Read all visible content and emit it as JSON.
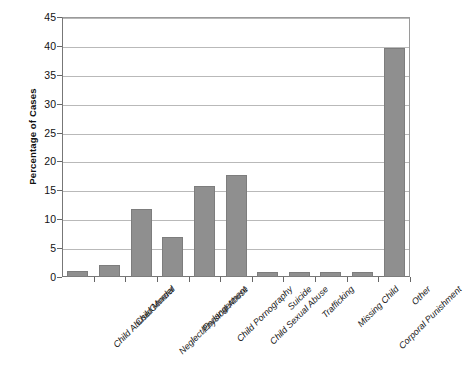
{
  "chart_data": {
    "type": "bar",
    "title": "",
    "subtitle": "",
    "xlabel": "",
    "ylabel": "Percentage of Cases",
    "ylim": [
      0,
      45
    ],
    "ytick_step": 5,
    "yticks": [
      0,
      5,
      10,
      15,
      20,
      25,
      30,
      35,
      40,
      45
    ],
    "grid": true,
    "legend": false,
    "legend_position": "none",
    "bar_color": "#8f8f8f",
    "gridline_color": "#b9b9b9",
    "axis_color": "#777777",
    "categories": [
      "Child Abuse/General",
      "Child Murder",
      "Neglect/Endangerment",
      "Physical Abuse",
      "Child Pornography",
      "Child Sexual Abuse",
      "Suicide",
      "Trafficking",
      "Missing Child",
      "Corporal Punishment",
      "Other"
    ],
    "values": [
      1.0,
      2.0,
      11.8,
      6.9,
      15.8,
      17.7,
      0.8,
      0.8,
      0.8,
      0.8,
      39.7
    ]
  }
}
